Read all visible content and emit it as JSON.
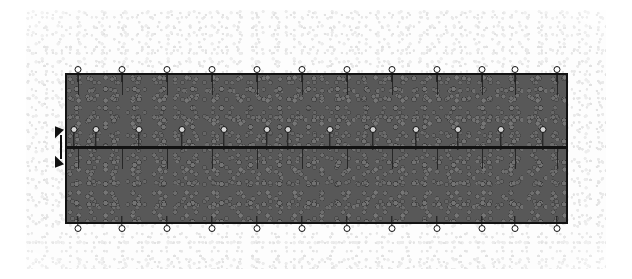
{
  "figure": {
    "type": "engineering-diagram",
    "canvas": {
      "width": 632,
      "height": 279,
      "background_color": "#ffffff"
    },
    "background_field": {
      "name": "mottled-paper-texture",
      "color": "#ededed",
      "x": 26,
      "y": 10,
      "width": 580,
      "height": 259
    },
    "plate": {
      "label": "textured-plate",
      "fill_color": "#585858",
      "outline_color": "#121212",
      "outline_width": 2,
      "x": 65,
      "y": 73,
      "width": 503,
      "height": 151
    },
    "mid_line": {
      "label": "horizontal-divider",
      "color": "#121212",
      "y": 146,
      "thickness": 3
    },
    "supports": {
      "ring_color": "#ffffff",
      "ring_outline_color": "#131313",
      "stem_color": "#161616",
      "top_row": {
        "count": 12,
        "y": 66,
        "x_positions": [
          78,
          122,
          167,
          212,
          257,
          302,
          347,
          392,
          437,
          482,
          515,
          557
        ]
      },
      "mid_row": {
        "count": 13,
        "y": 126,
        "x_positions": [
          74,
          96,
          139,
          182,
          224,
          267,
          288,
          330,
          373,
          416,
          458,
          501,
          543
        ]
      },
      "bottom_row": {
        "count": 12,
        "y": 216,
        "x_positions": [
          78,
          122,
          167,
          212,
          257,
          302,
          347,
          392,
          437,
          482,
          515,
          557
        ]
      }
    },
    "grid_ticks": {
      "label": "internal-vertical-ticks",
      "color": "#1c1c1c",
      "upper_y": 75,
      "upper_height": 20,
      "lower_y": 149,
      "lower_height": 20,
      "x_positions": [
        78,
        122,
        167,
        212,
        257,
        302,
        347,
        392,
        437,
        482,
        515,
        557
      ]
    },
    "dimension_marker": {
      "label": "double-arrow-dimension",
      "color": "#111111",
      "x": 53,
      "y": 123,
      "width": 16,
      "height": 48,
      "direction": "vertical-double"
    }
  }
}
